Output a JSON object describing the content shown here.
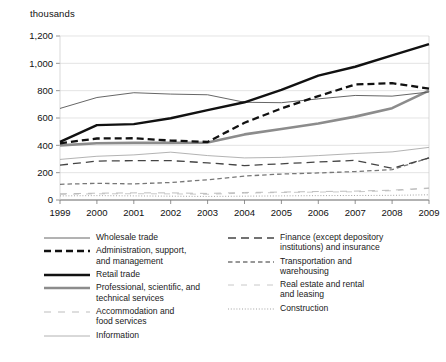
{
  "axis_unit_label": "thousands",
  "chart_data": {
    "type": "line",
    "title": "",
    "subtitle": "",
    "xlabel": "",
    "ylabel": "thousands",
    "ylim": [
      0,
      1200
    ],
    "ytick_step": 200,
    "ytick_labels": [
      "0",
      "200",
      "400",
      "600",
      "800",
      "1,000",
      "1,200"
    ],
    "ytick_values": [
      0,
      200,
      400,
      600,
      800,
      1000,
      1200
    ],
    "categories": [
      "1999",
      "2000",
      "2001",
      "2002",
      "2003",
      "2004",
      "2005",
      "2006",
      "2007",
      "2008",
      "2009"
    ],
    "x": [
      1999,
      2000,
      2001,
      2002,
      2003,
      2004,
      2005,
      2006,
      2007,
      2008,
      2009
    ],
    "grid": "horizontal",
    "legend_position": "bottom",
    "series": [
      {
        "name": "Wholesale trade",
        "style": "thin-solid",
        "color": "#555555",
        "values": [
          670,
          750,
          785,
          775,
          770,
          715,
          712,
          740,
          765,
          760,
          790
        ]
      },
      {
        "name": "Administration, support,\nand management",
        "style": "bold-dashed",
        "color": "#111111",
        "values": [
          415,
          450,
          452,
          435,
          425,
          565,
          670,
          760,
          845,
          855,
          815
        ]
      },
      {
        "name": "Retail trade",
        "style": "bold-solid",
        "color": "#111111",
        "values": [
          425,
          548,
          555,
          598,
          658,
          715,
          805,
          910,
          975,
          1058,
          1140
        ]
      },
      {
        "name": "Professional, scientific, and\ntechnical services",
        "style": "bold-solid-gray",
        "color": "#8c8c8c",
        "values": [
          400,
          415,
          418,
          418,
          420,
          480,
          520,
          560,
          610,
          672,
          800
        ]
      },
      {
        "name": "Accommodation and\nfood services",
        "style": "light-dashed",
        "color": "#b5b5b5",
        "values": [
          45,
          50,
          52,
          52,
          48,
          55,
          58,
          62,
          65,
          72,
          88
        ]
      },
      {
        "name": "Information",
        "style": "thin-solid-light",
        "color": "#a0a0a0",
        "values": [
          297,
          320,
          330,
          350,
          325,
          308,
          312,
          325,
          340,
          352,
          385
        ]
      },
      {
        "name": "Finance (except depository\ninstitutions) and insurance",
        "style": "medium-dash-long",
        "color": "#444444",
        "values": [
          255,
          285,
          288,
          288,
          272,
          252,
          265,
          278,
          290,
          232,
          308
        ]
      },
      {
        "name": "Transportation and\nwarehousing",
        "style": "fine-dashed",
        "color": "#777777",
        "values": [
          115,
          122,
          118,
          128,
          148,
          175,
          190,
          198,
          208,
          222,
          308
        ]
      },
      {
        "name": "Real estate and rental\nand leasing",
        "style": "very-light-dashed",
        "color": "#c2c2c2",
        "values": [
          42,
          45,
          46,
          45,
          42,
          50,
          55,
          58,
          60,
          68,
          85
        ]
      },
      {
        "name": "Construction",
        "style": "dotted",
        "color": "#999999",
        "values": [
          30,
          32,
          30,
          28,
          26,
          28,
          30,
          32,
          33,
          34,
          38
        ]
      }
    ]
  },
  "legend": {
    "left_column": [
      {
        "label": "Wholesale trade",
        "swatch": "thin-solid"
      },
      {
        "label": "Administration, support,\nand management",
        "swatch": "bold-dashed"
      },
      {
        "label": "Retail trade",
        "swatch": "bold-solid"
      },
      {
        "label": "Professional, scientific, and\ntechnical services",
        "swatch": "bold-solid-gray"
      },
      {
        "label": "Accommodation and\nfood services",
        "swatch": "light-dashed"
      },
      {
        "label": "Information",
        "swatch": "thin-solid-light"
      }
    ],
    "right_column": [
      {
        "label": "Finance (except depository\ninstitutions) and insurance",
        "swatch": "medium-dash-long"
      },
      {
        "label": "Transportation and\nwarehousing",
        "swatch": "fine-dashed"
      },
      {
        "label": "Real estate and rental\nand leasing",
        "swatch": "very-light-dashed"
      },
      {
        "label": "Construction",
        "swatch": "dotted"
      }
    ]
  }
}
